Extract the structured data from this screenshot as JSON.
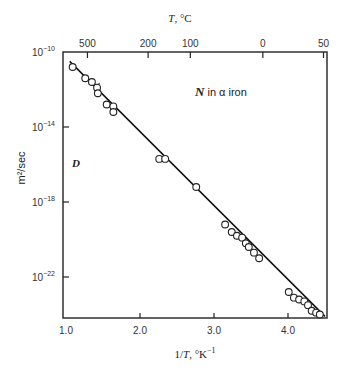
{
  "chart_data": {
    "type": "scatter",
    "title": "N in α iron",
    "annotations": [
      {
        "text_italic": "N",
        "text": " in α iron",
        "position": "upper-right"
      },
      {
        "text_italic": "D",
        "position": "left-middle"
      }
    ],
    "xlabel": "1/T, °K⁻¹",
    "ylabel": "m²/sec",
    "top_xlabel": "T, °C",
    "xlim": [
      1.0,
      4.53
    ],
    "ylim_log10": [
      -23.9,
      -10
    ],
    "yscale": "log",
    "grid": false,
    "legend": null,
    "x_ticks": [
      {
        "value": 1.0,
        "label": "1.0"
      },
      {
        "value": 2.0,
        "label": "2.0"
      },
      {
        "value": 3.0,
        "label": "3.0"
      },
      {
        "value": 4.0,
        "label": "4.0"
      }
    ],
    "y_ticks": [
      {
        "log10": -10,
        "base": "10",
        "exp": "−10"
      },
      {
        "log10": -14,
        "base": "10",
        "exp": "−14"
      },
      {
        "log10": -18,
        "base": "10",
        "exp": "−18"
      },
      {
        "log10": -22,
        "base": "10",
        "exp": "−22"
      }
    ],
    "top_ticks": [
      {
        "label": "500",
        "inv_T": 1.29
      },
      {
        "label": "200",
        "inv_T": 2.11
      },
      {
        "label": "100",
        "inv_T": 2.68
      },
      {
        "label": "0",
        "inv_T": 3.66
      },
      {
        "label": "50",
        "inv_T": 4.48
      }
    ],
    "series": [
      {
        "name": "measurements",
        "marker": "open-circle",
        "points": [
          {
            "x": 1.09,
            "log10_y": -10.8
          },
          {
            "x": 1.26,
            "log10_y": -11.4
          },
          {
            "x": 1.35,
            "log10_y": -11.6
          },
          {
            "x": 1.42,
            "log10_y": -11.9
          },
          {
            "x": 1.43,
            "log10_y": -12.2
          },
          {
            "x": 1.55,
            "log10_y": -12.8
          },
          {
            "x": 1.64,
            "log10_y": -12.9
          },
          {
            "x": 1.64,
            "log10_y": -13.2
          },
          {
            "x": 2.26,
            "log10_y": -15.7
          },
          {
            "x": 2.34,
            "log10_y": -15.7
          },
          {
            "x": 2.76,
            "log10_y": -17.2
          },
          {
            "x": 3.15,
            "log10_y": -19.2
          },
          {
            "x": 3.24,
            "log10_y": -19.6
          },
          {
            "x": 3.31,
            "log10_y": -19.8
          },
          {
            "x": 3.38,
            "log10_y": -19.9
          },
          {
            "x": 3.43,
            "log10_y": -20.2
          },
          {
            "x": 3.47,
            "log10_y": -20.4
          },
          {
            "x": 3.54,
            "log10_y": -20.7
          },
          {
            "x": 3.61,
            "log10_y": -21.0
          },
          {
            "x": 4.01,
            "log10_y": -22.8
          },
          {
            "x": 4.08,
            "log10_y": -23.1
          },
          {
            "x": 4.15,
            "log10_y": -23.2
          },
          {
            "x": 4.22,
            "log10_y": -23.3
          },
          {
            "x": 4.27,
            "log10_y": -23.5
          },
          {
            "x": 4.32,
            "log10_y": -23.8
          },
          {
            "x": 4.38,
            "log10_y": -23.9
          },
          {
            "x": 4.43,
            "log10_y": -24.0
          }
        ]
      },
      {
        "name": "fit",
        "type": "line",
        "points": [
          {
            "x": 1.05,
            "log10_y": -10.5
          },
          {
            "x": 4.5,
            "log10_y": -24.1
          }
        ]
      }
    ]
  },
  "labels": {
    "top_axis_title_var": "T",
    "top_axis_title_unit": ", °C",
    "bottom_axis_title_pre": "1/",
    "bottom_axis_title_var": "T",
    "bottom_axis_title_unit": ", °K",
    "bottom_axis_title_exp": "−1",
    "y_axis_title": "m²/sec",
    "d_label": "D",
    "annotation_n": "N",
    "annotation_rest": " in α iron"
  }
}
